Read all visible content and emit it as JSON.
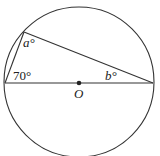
{
  "diagram": {
    "type": "geometry",
    "circle": {
      "center_label": "O"
    },
    "angles": {
      "left_vertex": "70°",
      "top_vertex": "a°",
      "right_vertex": "b°"
    },
    "labels": {
      "center": "O",
      "angle_a": "a°",
      "angle_b": "b°",
      "angle_70": "70°"
    },
    "colors": {
      "stroke": "#333333",
      "text": "#222222",
      "background": "#ffffff"
    }
  }
}
